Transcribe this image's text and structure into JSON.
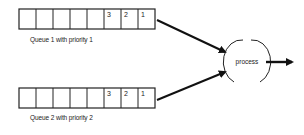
{
  "diagram": {
    "queues": [
      {
        "id": "queue1",
        "label": "Queue 1 with priority 1",
        "cells": [
          "",
          "",
          "",
          "",
          "",
          "3",
          "2",
          "1"
        ]
      },
      {
        "id": "queue2",
        "label": "Queue 2 with priority 2",
        "cells": [
          "",
          "",
          "",
          "",
          "",
          "3",
          "2",
          "1"
        ]
      }
    ],
    "process_node": {
      "label": "process"
    },
    "colors": {
      "stroke": "#111111",
      "background": "#ffffff"
    }
  }
}
